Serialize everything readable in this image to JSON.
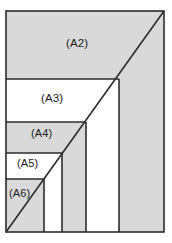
{
  "figure": {
    "canvas": {
      "width": 172,
      "height": 243,
      "background": "#ffffff"
    },
    "frame": {
      "x": 6,
      "y": 11,
      "width": 158,
      "height": 221
    },
    "colors": {
      "shaded_fill": "#d9d9d9",
      "plain_fill": "#ffffff",
      "stroke": "#2b2b2b",
      "label_text": "#1a1a1a"
    },
    "stroke_width": 1.6,
    "diagonal": {
      "name": "aspect-ratio-diagonal",
      "from": {
        "x": 6,
        "y": 232
      },
      "to": {
        "x": 164,
        "y": 11
      }
    },
    "horizontal_dividers_y": [
      79,
      122,
      153,
      179
    ],
    "vertical_dividers_x": [
      44,
      62,
      86,
      119
    ],
    "regions": [
      {
        "id": "a2",
        "label": "(A2)",
        "fill": "shaded",
        "x": 6,
        "y": 11,
        "width": 158,
        "height": 68
      },
      {
        "id": "a3",
        "label": "(A3)",
        "fill": "plain",
        "x": 6,
        "y": 79,
        "width": 113,
        "height": 43
      },
      {
        "id": "a4",
        "label": "(A4)",
        "fill": "shaded",
        "x": 6,
        "y": 122,
        "width": 80,
        "height": 31
      },
      {
        "id": "a5",
        "label": "(A5)",
        "fill": "plain",
        "x": 6,
        "y": 153,
        "width": 56,
        "height": 26
      },
      {
        "id": "a6",
        "label": "(A6)",
        "fill": "shaded",
        "x": 6,
        "y": 179,
        "width": 38,
        "height": 53
      }
    ],
    "right_strips": [
      {
        "id": "strip-a3-right",
        "fill": "shaded",
        "x": 119,
        "y": 79,
        "width": 45,
        "height": 153
      },
      {
        "id": "strip-a4-right",
        "fill": "plain",
        "x": 86,
        "y": 122,
        "width": 33,
        "height": 110
      },
      {
        "id": "strip-a5-right",
        "fill": "shaded",
        "x": 62,
        "y": 153,
        "width": 24,
        "height": 79
      },
      {
        "id": "strip-a6-right",
        "fill": "plain",
        "x": 44,
        "y": 179,
        "width": 18,
        "height": 53
      }
    ],
    "labels": {
      "a2": "(A2)",
      "a3": "(A3)",
      "a4": "(A4)",
      "a5": "(A5)",
      "a6": "(A6)"
    }
  }
}
